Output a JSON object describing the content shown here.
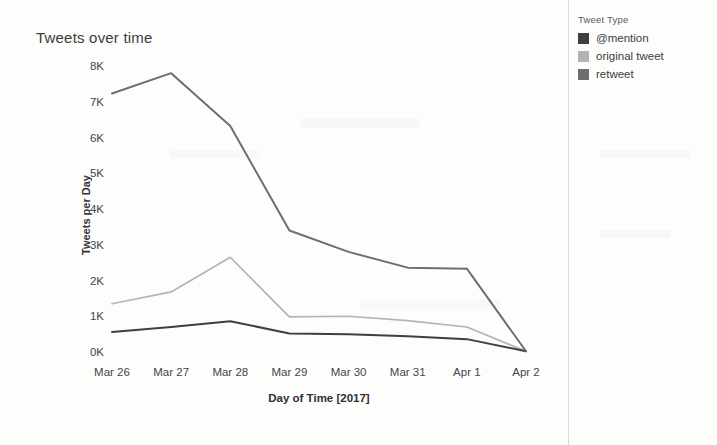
{
  "chart_data": {
    "type": "line",
    "title": "Tweets over time",
    "xlabel": "Day of Time [2017]",
    "ylabel": "Tweets per Day",
    "categories": [
      "Mar 26",
      "Mar 27",
      "Mar 28",
      "Mar 29",
      "Mar 30",
      "Mar 31",
      "Apr 1",
      "Apr 2"
    ],
    "ytick_labels": [
      "8K",
      "7K",
      "6K",
      "5K",
      "4K",
      "3K",
      "2K",
      "1K",
      "0K"
    ],
    "ytick_values": [
      8000,
      7000,
      6000,
      5000,
      4000,
      3000,
      2000,
      1000,
      0
    ],
    "ylim": [
      0,
      8000
    ],
    "grid": false,
    "legend_position": "right",
    "legend_title": "Tweet Type",
    "series": [
      {
        "name": "@mention",
        "color": "#3f3f3f",
        "values": [
          560,
          700,
          860,
          520,
          500,
          440,
          360,
          20
        ]
      },
      {
        "name": "original tweet",
        "color": "#b4b4b4",
        "values": [
          1350,
          1680,
          2650,
          980,
          1000,
          880,
          700,
          20
        ]
      },
      {
        "name": "retweet",
        "color": "#6e6e6e",
        "values": [
          7230,
          7800,
          6320,
          3400,
          2800,
          2360,
          2330,
          20
        ]
      }
    ]
  },
  "legend": {
    "title": "Tweet Type",
    "items": [
      {
        "label": "@mention",
        "color": "#3f3f3f"
      },
      {
        "label": "original tweet",
        "color": "#b4b4b4"
      },
      {
        "label": "retweet",
        "color": "#6e6e6e"
      }
    ]
  }
}
